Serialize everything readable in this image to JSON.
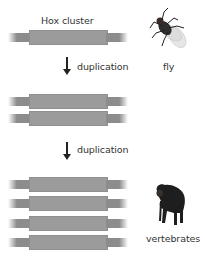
{
  "title_label": "Hox cluster",
  "steps": [
    {
      "label": "duplication"
    },
    {
      "label": "duplication"
    }
  ],
  "organisms": {
    "fly": {
      "label": "fly",
      "icon": "fly-icon"
    },
    "vertebrates": {
      "label": "vertebrates",
      "icon": "chimpanzee-icon"
    }
  },
  "stages": [
    {
      "name": "fly",
      "cluster_count": 1
    },
    {
      "name": "intermediate",
      "cluster_count": 2
    },
    {
      "name": "vertebrates",
      "cluster_count": 4
    }
  ],
  "colors": {
    "cluster_block": "#9b9b9b",
    "flank": "#8c8c8c",
    "arrow": "#222222",
    "text": "#333333"
  }
}
